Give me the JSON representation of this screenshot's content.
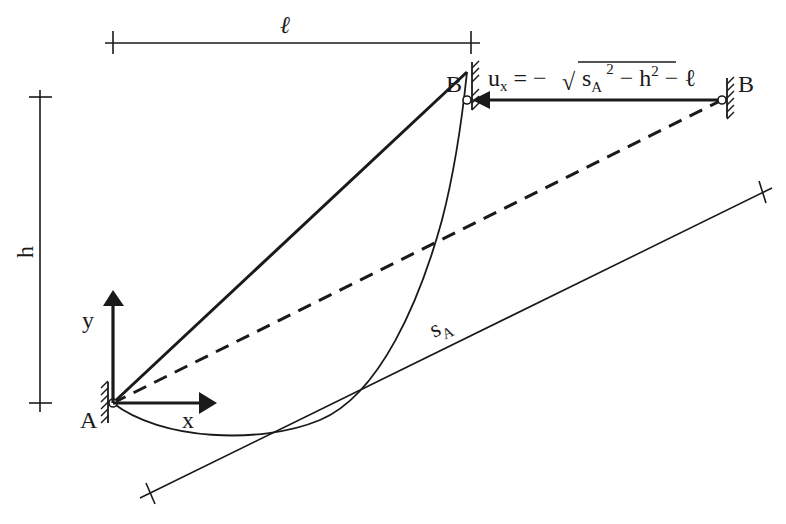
{
  "diagram": {
    "type": "structural-mechanics-sketch",
    "colors": {
      "ink": "#1a1a1a",
      "background": "#ffffff"
    },
    "dimensions": {
      "horizontal": {
        "label": "ℓ"
      },
      "vertical": {
        "label": "h"
      },
      "length": {
        "label_main": "s",
        "label_sub": "A"
      }
    },
    "points": {
      "A": {
        "label": "A"
      },
      "B_initial": {
        "label": "B"
      },
      "B_displaced": {
        "label": "B"
      }
    },
    "axes": {
      "x": {
        "label": "x"
      },
      "y": {
        "label": "y"
      }
    },
    "equation": {
      "lhs_main": "u",
      "lhs_sub": "x",
      "equals": "= −",
      "sqrt_symbol": "√",
      "term1_main": "s",
      "term1_sub": "A",
      "term1_sup": "2",
      "minus1": "− h",
      "term2_sup": "2",
      "minus2": "− ℓ"
    },
    "lines": [
      {
        "name": "straight-bar-A-B",
        "style": "solid-thick"
      },
      {
        "name": "chord-A-Bdisplaced",
        "style": "dashed"
      },
      {
        "name": "sagging-cable",
        "style": "solid-thin-curve"
      },
      {
        "name": "displacement-arrow",
        "style": "solid-thick-arrow"
      }
    ]
  }
}
